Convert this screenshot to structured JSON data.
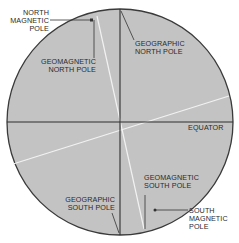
{
  "diagram": {
    "title": "",
    "colors": {
      "globe_fill": "#c3c3c3",
      "globe_outline": "#3a3a3a",
      "axis_line": "#2e2e2e",
      "magnetic_line": "#f2f2f2",
      "leader_line": "#333333",
      "label_text": "#2a2a2a"
    },
    "labels": {
      "north_magnetic_pole": "NORTH\nMAGNETIC\nPOLE",
      "geomagnetic_north_pole": "GEOMAGNETIC\nNORTH POLE",
      "geographic_north_pole": "GEOGRAPHIC\nNORTH POLE",
      "equator": "EQUATOR",
      "geographic_south_pole": "GEOGRAPHIC\nSOUTH POLE",
      "geomagnetic_south_pole": "GEOMAGNETIC\nSOUTH POLE",
      "south_magnetic_pole": "SOUTH\nMAGNETIC\nPOLE"
    }
  }
}
